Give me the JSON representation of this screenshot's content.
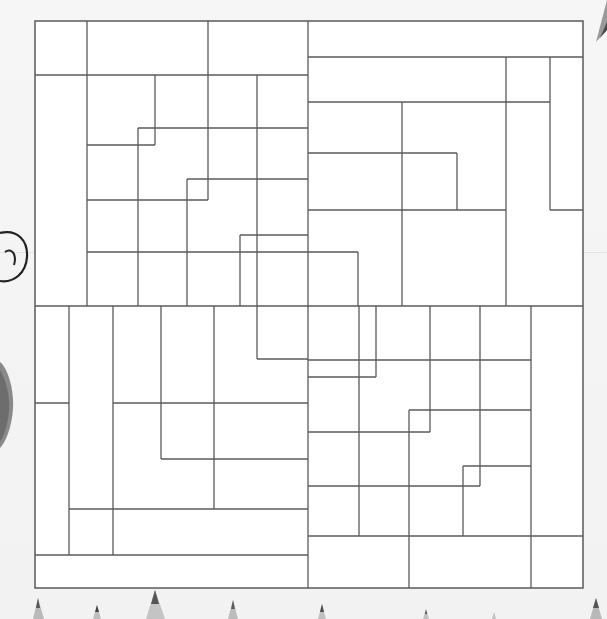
{
  "page": {
    "title": "",
    "background": "#f4f4f4",
    "line_color": "#5a5a5a"
  },
  "puzzle": {
    "type": "line-grid-coloring-page",
    "frame": {
      "x": 35,
      "y": 21,
      "width": 548,
      "height": 567
    },
    "quadrants": [
      "top-left",
      "top-right",
      "bottom-left",
      "bottom-right"
    ]
  },
  "decorations": {
    "left_doodle": "swirl-circle",
    "left_object": "stone",
    "bottom_row": "colored-pencil-tips",
    "top_right": "pencil-tip"
  }
}
